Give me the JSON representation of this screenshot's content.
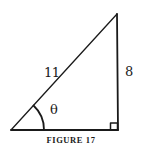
{
  "figure": {
    "caption": "FIGURE 17",
    "triangle": {
      "type": "right-triangle",
      "vertices": {
        "angle_vertex": [
          11,
          130
        ],
        "right_angle_vertex": [
          118,
          130
        ],
        "top_vertex": [
          117,
          14
        ]
      },
      "labels": {
        "hypotenuse": "11",
        "opposite": "8",
        "angle": "θ"
      },
      "right_angle_marker": true
    },
    "stroke_color": "#1a1a1a"
  }
}
